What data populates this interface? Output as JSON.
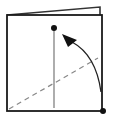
{
  "diagram": {
    "type": "origami-fold-step",
    "colors": {
      "stroke": "#1a1a1a",
      "back_flap": "#333333",
      "center_line": "#777777",
      "dashed_fold": "#888888",
      "arrow": "#222222",
      "background": "#ffffff"
    },
    "elements": {
      "back_flap": {
        "points": "7,15 100,7 100,15"
      },
      "front_square": {
        "x": 7,
        "y": 15,
        "width": 95,
        "height": 96
      },
      "center_crease": {
        "x1": 54,
        "y1": 28,
        "x2": 54,
        "y2": 108
      },
      "valley_fold_line": {
        "x1": 9,
        "y1": 109,
        "x2": 98,
        "y2": 58
      },
      "target_point": {
        "cx": 54,
        "cy": 28,
        "r": 3
      },
      "source_point": {
        "cx": 103,
        "cy": 111,
        "r": 3
      },
      "fold_arrow": {
        "path": "M101,92 Q96,55 72,42",
        "head": "62,34 77,40 68,47"
      }
    }
  }
}
